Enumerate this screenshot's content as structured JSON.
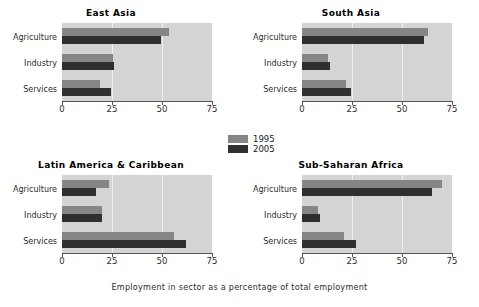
{
  "chart_data": {
    "type": "bar",
    "orientation": "horizontal",
    "title": "",
    "xlabel": "Employment in sector as a percentage of total employment",
    "ylabel": "",
    "xlim": [
      0,
      75
    ],
    "xticks": [
      0,
      25,
      50,
      75
    ],
    "grid": true,
    "legend_position": "center",
    "categories": [
      "Agriculture",
      "Industry",
      "Services"
    ],
    "legend": [
      "1995",
      "2005"
    ],
    "colors": {
      "1995": "#868686",
      "2005": "#2f2f2f",
      "plot_background": "#d4d4d4",
      "gridline": "#efefef",
      "figure_background": "#ffffff"
    },
    "panels": [
      {
        "title": "East Asia",
        "series": [
          {
            "name": "1995",
            "values": [
              53.5,
              25.5,
              19.0
            ]
          },
          {
            "name": "2005",
            "values": [
              49.5,
              26.0,
              24.5
            ]
          }
        ]
      },
      {
        "title": "South Asia",
        "series": [
          {
            "name": "1995",
            "values": [
              63.0,
              13.0,
              22.0
            ]
          },
          {
            "name": "2005",
            "values": [
              61.0,
              14.0,
              24.5
            ]
          }
        ]
      },
      {
        "title": "Latin America & Caribbean",
        "series": [
          {
            "name": "1995",
            "values": [
              23.5,
              20.0,
              56.0
            ]
          },
          {
            "name": "2005",
            "values": [
              17.0,
              20.0,
              62.0
            ]
          }
        ]
      },
      {
        "title": "Sub-Saharan Africa",
        "series": [
          {
            "name": "1995",
            "values": [
              70.0,
              8.0,
              21.0
            ]
          },
          {
            "name": "2005",
            "values": [
              65.0,
              9.0,
              27.0
            ]
          }
        ]
      }
    ]
  },
  "figure": {
    "xlabel": "Employment in sector as a percentage of total employment"
  },
  "legend": {
    "items": [
      {
        "label": "1995"
      },
      {
        "label": "2005"
      }
    ]
  },
  "panels": [
    {
      "title": "East Asia"
    },
    {
      "title": "South Asia"
    },
    {
      "title": "Latin America & Caribbean"
    },
    {
      "title": "Sub-Saharan Africa"
    }
  ],
  "axes": {
    "categories": [
      "Agriculture",
      "Industry",
      "Services"
    ],
    "xticks": [
      "0",
      "25",
      "50",
      "75"
    ]
  }
}
